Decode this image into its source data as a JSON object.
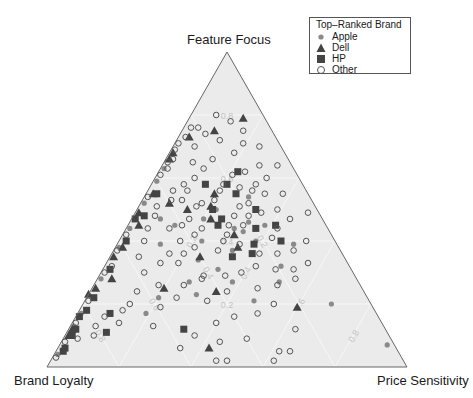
{
  "chart_data": {
    "type": "scatter",
    "subtype": "ternary",
    "title": "",
    "vertices": {
      "top": "Feature Focus",
      "bottom_left": "Brand Loyalty",
      "bottom_right": "Price Sensitivity"
    },
    "grid": true,
    "grid_ticks": [
      0.2,
      0.4,
      0.6,
      0.8
    ],
    "grid_tick_labels": [
      "0.2",
      "0.4",
      "0.6",
      "0.8"
    ],
    "legend": {
      "title": "Top–Ranked Brand",
      "position": "top-right",
      "entries": [
        {
          "label": "Apple",
          "marker": "filled-circle",
          "color": "#8a8a8a"
        },
        {
          "label": "Dell",
          "marker": "filled-triangle",
          "color": "#444444"
        },
        {
          "label": "HP",
          "marker": "filled-square",
          "color": "#444444"
        },
        {
          "label": "Other",
          "marker": "open-circle",
          "color": "#555555"
        }
      ]
    },
    "point_order": "[brand_loyalty, feature_focus, price_sensitivity]",
    "series": [
      {
        "name": "Apple",
        "points": [
          [
            0.55,
            0.44,
            0.01
          ],
          [
            0.52,
            0.47,
            0.01
          ],
          [
            0.47,
            0.52,
            0.01
          ],
          [
            0.4,
            0.59,
            0.01
          ],
          [
            0.36,
            0.63,
            0.01
          ],
          [
            0.86,
            0.13,
            0.01
          ],
          [
            0.82,
            0.17,
            0.01
          ],
          [
            0.71,
            0.28,
            0.01
          ],
          [
            0.61,
            0.38,
            0.01
          ],
          [
            0.95,
            0.04,
            0.01
          ],
          [
            0.49,
            0.39,
            0.12
          ],
          [
            0.45,
            0.47,
            0.08
          ],
          [
            0.42,
            0.45,
            0.13
          ],
          [
            0.37,
            0.4,
            0.23
          ],
          [
            0.31,
            0.47,
            0.22
          ],
          [
            0.28,
            0.5,
            0.22
          ],
          [
            0.33,
            0.47,
            0.2
          ],
          [
            0.41,
            0.34,
            0.25
          ],
          [
            0.47,
            0.27,
            0.26
          ],
          [
            0.37,
            0.31,
            0.32
          ],
          [
            0.26,
            0.44,
            0.3
          ],
          [
            0.3,
            0.37,
            0.33
          ],
          [
            0.17,
            0.54,
            0.29
          ],
          [
            0.21,
            0.46,
            0.33
          ],
          [
            0.35,
            0.27,
            0.38
          ],
          [
            0.47,
            0.23,
            0.3
          ],
          [
            0.64,
            0.17,
            0.19
          ],
          [
            0.58,
            0.22,
            0.2
          ],
          [
            0.17,
            0.45,
            0.38
          ],
          [
            0.12,
            0.39,
            0.49
          ],
          [
            0.19,
            0.32,
            0.49
          ],
          [
            0.22,
            0.27,
            0.51
          ],
          [
            0.11,
            0.2,
            0.69
          ],
          [
            0.02,
            0.07,
            0.91
          ],
          [
            0.32,
            0.21,
            0.47
          ],
          [
            0.22,
            0.4,
            0.38
          ],
          [
            0.24,
            0.43,
            0.33
          ]
        ]
      },
      {
        "name": "Dell",
        "points": [
          [
            0.33,
            0.66,
            0.01
          ],
          [
            0.5,
            0.49,
            0.01
          ],
          [
            0.64,
            0.35,
            0.01
          ],
          [
            0.74,
            0.25,
            0.01
          ],
          [
            0.87,
            0.12,
            0.01
          ],
          [
            0.89,
            0.1,
            0.01
          ],
          [
            0.6,
            0.38,
            0.02
          ],
          [
            0.52,
            0.45,
            0.03
          ],
          [
            0.43,
            0.55,
            0.02
          ],
          [
            0.31,
            0.68,
            0.01
          ],
          [
            0.24,
            0.73,
            0.03
          ],
          [
            0.16,
            0.75,
            0.09
          ],
          [
            0.06,
            0.79,
            0.15
          ],
          [
            0.4,
            0.52,
            0.08
          ],
          [
            0.36,
            0.5,
            0.14
          ],
          [
            0.29,
            0.51,
            0.2
          ],
          [
            0.26,
            0.55,
            0.19
          ],
          [
            0.31,
            0.47,
            0.22
          ],
          [
            0.27,
            0.42,
            0.31
          ],
          [
            0.28,
            0.38,
            0.34
          ],
          [
            0.4,
            0.35,
            0.25
          ],
          [
            0.41,
            0.24,
            0.35
          ],
          [
            0.8,
            0.24,
            -0.04
          ],
          [
            0.55,
            0.25,
            0.2
          ],
          [
            0.21,
            0.19,
            0.6
          ],
          [
            0.52,
            0.06,
            0.42
          ],
          [
            0.68,
            0.28,
            0.04
          ]
        ]
      },
      {
        "name": "HP",
        "points": [
          [
            0.92,
            0.06,
            0.02
          ],
          [
            0.93,
            0.05,
            0.02
          ],
          [
            0.88,
            0.1,
            0.02
          ],
          [
            0.8,
            0.18,
            0.02
          ],
          [
            0.76,
            0.22,
            0.02
          ],
          [
            0.67,
            0.31,
            0.02
          ],
          [
            0.58,
            0.4,
            0.02
          ],
          [
            0.49,
            0.48,
            0.03
          ],
          [
            0.83,
            0.16,
            0.01
          ],
          [
            0.74,
            0.17,
            0.09
          ],
          [
            0.52,
            0.47,
            0.01
          ],
          [
            0.42,
            0.55,
            0.03
          ],
          [
            0.27,
            0.58,
            0.15
          ],
          [
            0.21,
            0.58,
            0.21
          ],
          [
            0.29,
            0.5,
            0.21
          ],
          [
            0.3,
            0.45,
            0.25
          ],
          [
            0.28,
            0.47,
            0.25
          ],
          [
            0.17,
            0.5,
            0.33
          ],
          [
            0.31,
            0.35,
            0.34
          ],
          [
            0.25,
            0.36,
            0.39
          ],
          [
            0.23,
            0.39,
            0.38
          ],
          [
            0.2,
            0.44,
            0.36
          ],
          [
            0.15,
            0.4,
            0.45
          ],
          [
            0.2,
            0.55,
            0.25
          ],
          [
            0.56,
            0.12,
            0.32
          ],
          [
            0.78,
            0.11,
            0.11
          ],
          [
            0.86,
            0.12,
            0.02
          ],
          [
            0.16,
            0.62,
            0.22
          ],
          [
            0.14,
            0.45,
            0.41
          ]
        ]
      },
      {
        "name": "Other",
        "points": [
          [
            0.96,
            0.03,
            0.01
          ],
          [
            0.91,
            0.08,
            0.01
          ],
          [
            0.85,
            0.14,
            0.01
          ],
          [
            0.78,
            0.21,
            0.01
          ],
          [
            0.69,
            0.3,
            0.01
          ],
          [
            0.62,
            0.37,
            0.01
          ],
          [
            0.57,
            0.42,
            0.01
          ],
          [
            0.45,
            0.54,
            0.01
          ],
          [
            0.38,
            0.61,
            0.01
          ],
          [
            0.34,
            0.65,
            0.01
          ],
          [
            0.3,
            0.69,
            0.01
          ],
          [
            0.28,
            0.71,
            0.01
          ],
          [
            0.35,
            0.63,
            0.02
          ],
          [
            0.32,
            0.66,
            0.02
          ],
          [
            0.25,
            0.73,
            0.02
          ],
          [
            0.22,
            0.76,
            0.02
          ],
          [
            0.13,
            0.8,
            0.07
          ],
          [
            0.1,
            0.78,
            0.12
          ],
          [
            0.2,
            0.76,
            0.04
          ],
          [
            0.19,
            0.74,
            0.07
          ],
          [
            0.16,
            0.72,
            0.12
          ],
          [
            0.24,
            0.7,
            0.06
          ],
          [
            0.27,
            0.65,
            0.08
          ],
          [
            0.21,
            0.66,
            0.13
          ],
          [
            0.25,
            0.63,
            0.12
          ],
          [
            0.14,
            0.68,
            0.18
          ],
          [
            0.1,
            0.71,
            0.19
          ],
          [
            0.08,
            0.75,
            0.17
          ],
          [
            0.06,
            0.7,
            0.24
          ],
          [
            0.09,
            0.64,
            0.27
          ],
          [
            0.04,
            0.64,
            0.32
          ],
          [
            0.14,
            0.62,
            0.24
          ],
          [
            0.18,
            0.61,
            0.21
          ],
          [
            0.22,
            0.58,
            0.2
          ],
          [
            0.29,
            0.6,
            0.11
          ],
          [
            0.33,
            0.58,
            0.09
          ],
          [
            0.37,
            0.56,
            0.07
          ],
          [
            0.44,
            0.51,
            0.05
          ],
          [
            0.39,
            0.53,
            0.08
          ],
          [
            0.33,
            0.56,
            0.11
          ],
          [
            0.13,
            0.58,
            0.29
          ],
          [
            0.09,
            0.6,
            0.31
          ],
          [
            0.07,
            0.55,
            0.38
          ],
          [
            0.12,
            0.55,
            0.33
          ],
          [
            0.18,
            0.57,
            0.25
          ],
          [
            0.24,
            0.56,
            0.2
          ],
          [
            0.31,
            0.52,
            0.17
          ],
          [
            0.36,
            0.53,
            0.11
          ],
          [
            0.46,
            0.48,
            0.06
          ],
          [
            0.5,
            0.44,
            0.06
          ],
          [
            0.53,
            0.4,
            0.07
          ],
          [
            0.57,
            0.35,
            0.08
          ],
          [
            0.44,
            0.44,
            0.12
          ],
          [
            0.4,
            0.45,
            0.15
          ],
          [
            0.37,
            0.47,
            0.16
          ],
          [
            0.33,
            0.51,
            0.16
          ],
          [
            0.27,
            0.53,
            0.2
          ],
          [
            0.21,
            0.51,
            0.28
          ],
          [
            0.18,
            0.52,
            0.3
          ],
          [
            0.16,
            0.49,
            0.35
          ],
          [
            0.11,
            0.5,
            0.39
          ],
          [
            0.09,
            0.47,
            0.44
          ],
          [
            0.03,
            0.49,
            0.48
          ],
          [
            0.08,
            0.4,
            0.52
          ],
          [
            0.14,
            0.44,
            0.42
          ],
          [
            0.17,
            0.41,
            0.42
          ],
          [
            0.23,
            0.45,
            0.32
          ],
          [
            0.27,
            0.45,
            0.28
          ],
          [
            0.35,
            0.44,
            0.21
          ],
          [
            0.38,
            0.42,
            0.2
          ],
          [
            0.43,
            0.4,
            0.17
          ],
          [
            0.48,
            0.36,
            0.16
          ],
          [
            0.52,
            0.33,
            0.15
          ],
          [
            0.58,
            0.3,
            0.12
          ],
          [
            0.63,
            0.24,
            0.13
          ],
          [
            0.7,
            0.18,
            0.12
          ],
          [
            0.76,
            0.16,
            0.08
          ],
          [
            0.8,
            0.13,
            0.07
          ],
          [
            0.87,
            0.09,
            0.04
          ],
          [
            0.82,
            0.1,
            0.08
          ],
          [
            0.66,
            0.32,
            0.02
          ],
          [
            0.47,
            0.33,
            0.2
          ],
          [
            0.44,
            0.36,
            0.2
          ],
          [
            0.4,
            0.38,
            0.22
          ],
          [
            0.34,
            0.37,
            0.29
          ],
          [
            0.31,
            0.4,
            0.29
          ],
          [
            0.27,
            0.39,
            0.34
          ],
          [
            0.23,
            0.36,
            0.41
          ],
          [
            0.18,
            0.36,
            0.46
          ],
          [
            0.13,
            0.37,
            0.5
          ],
          [
            0.11,
            0.33,
            0.56
          ],
          [
            0.16,
            0.31,
            0.53
          ],
          [
            0.21,
            0.31,
            0.48
          ],
          [
            0.26,
            0.32,
            0.42
          ],
          [
            0.31,
            0.3,
            0.39
          ],
          [
            0.36,
            0.29,
            0.35
          ],
          [
            0.42,
            0.29,
            0.29
          ],
          [
            0.49,
            0.26,
            0.25
          ],
          [
            0.53,
            0.22,
            0.25
          ],
          [
            0.59,
            0.19,
            0.22
          ],
          [
            0.45,
            0.21,
            0.34
          ],
          [
            0.38,
            0.24,
            0.38
          ],
          [
            0.29,
            0.25,
            0.46
          ],
          [
            0.23,
            0.26,
            0.51
          ],
          [
            0.17,
            0.28,
            0.55
          ],
          [
            0.27,
            0.2,
            0.53
          ],
          [
            0.33,
            0.17,
            0.5
          ],
          [
            0.4,
            0.16,
            0.44
          ],
          [
            0.46,
            0.14,
            0.4
          ],
          [
            0.54,
            0.1,
            0.36
          ],
          [
            0.48,
            0.08,
            0.44
          ],
          [
            0.4,
            0.09,
            0.51
          ],
          [
            0.33,
            0.05,
            0.62
          ],
          [
            0.3,
            0.05,
            0.65
          ],
          [
            0.36,
            0.02,
            0.62
          ],
          [
            0.25,
            0.12,
            0.63
          ],
          [
            0.6,
            0.06,
            0.34
          ],
          [
            0.52,
            0.02,
            0.46
          ],
          [
            0.49,
            0.02,
            0.49
          ],
          [
            0.43,
            0.28,
            0.29
          ],
          [
            0.56,
            0.26,
            0.18
          ],
          [
            0.67,
            0.2,
            0.13
          ],
          [
            0.73,
            0.14,
            0.13
          ],
          [
            0.64,
            0.13,
            0.23
          ],
          [
            0.29,
            0.42,
            0.29
          ],
          [
            0.24,
            0.48,
            0.28
          ],
          [
            0.2,
            0.48,
            0.32
          ],
          [
            0.15,
            0.56,
            0.29
          ]
        ]
      }
    ]
  }
}
